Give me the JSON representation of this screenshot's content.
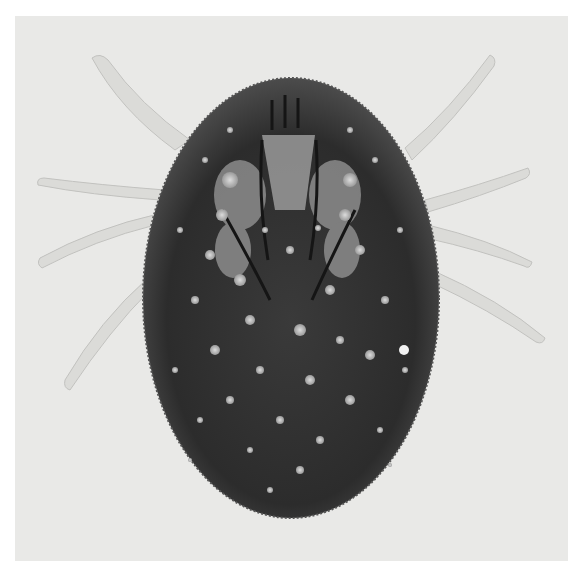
{
  "image": {
    "subject": "mite-specimen-micrograph",
    "description": "Grayscale micrograph of a mite/tick body (dorsal/ventral view) with eight pale translucent legs radiating from a dark, spotted oval body",
    "colors": {
      "background": "#e9e9e7",
      "frame": "#ffffff",
      "body_dark": "#2a2a2a",
      "body_mid": "#5a5a5a",
      "spots": "#c8c8c8",
      "legs": "#d6d6d4"
    }
  }
}
